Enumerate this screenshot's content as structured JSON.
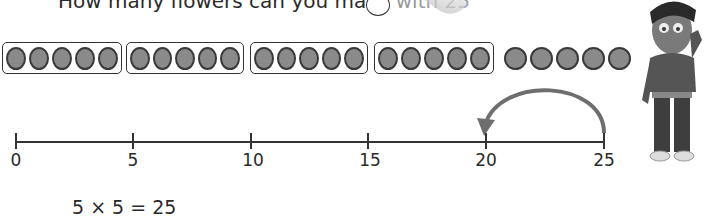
{
  "question": {
    "text_main": "How many flowers can you make ",
    "text_fade": "with 25",
    "answer_box": ""
  },
  "counters": {
    "fill_color": "#8a8a8a",
    "outline_color": "#3a3a3a",
    "groups": [
      {
        "boxed": true,
        "count": 5
      },
      {
        "boxed": true,
        "count": 5
      },
      {
        "boxed": true,
        "count": 5
      },
      {
        "boxed": true,
        "count": 5
      },
      {
        "boxed": false,
        "count": 5
      }
    ]
  },
  "number_line": {
    "start": 0,
    "end": 25,
    "ticks": [
      "0",
      "5",
      "10",
      "15",
      "20",
      "25"
    ],
    "jump": {
      "from": 25,
      "to": 20,
      "direction": "backward"
    }
  },
  "equation": "5 × 5 = 25"
}
